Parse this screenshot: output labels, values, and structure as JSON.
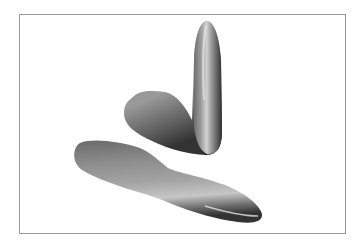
{
  "figure": {
    "frame_color": "#9a9a9a",
    "background_color": "#ffffff",
    "shapes": [
      {
        "name": "bent-shape",
        "description": "L-shaped blob with vertical tapered arm and rounded hump on left"
      },
      {
        "name": "elongated-shape",
        "description": "Long peanut-shaped blob with a waist near the middle"
      }
    ],
    "shading": {
      "light": "#c8c8c8",
      "mid": "#8a8a8a",
      "dark": "#3a3a3a"
    }
  }
}
